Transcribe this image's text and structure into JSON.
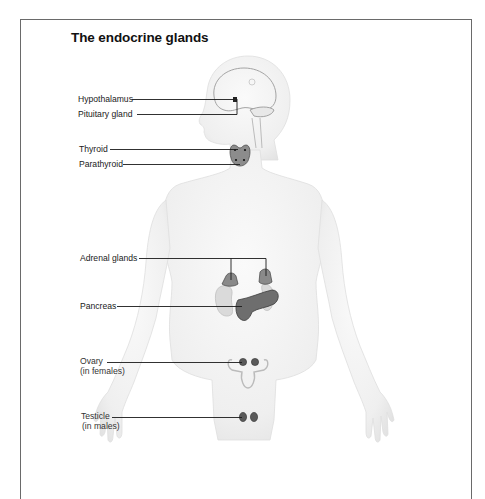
{
  "diagram": {
    "title": "The endocrine glands",
    "labels": {
      "hypothalamus": "Hypothalamus",
      "pituitary": "Pituitary gland",
      "thyroid": "Thyroid",
      "parathyroid": "Parathyroid",
      "adrenal": "Adrenal glands",
      "pancreas": "Pancreas",
      "ovary": "Ovary",
      "ovary_note": "(in females)",
      "testicle": "Testicle",
      "testicle_note": "(in males)"
    },
    "colors": {
      "frame": "#6a6a6a",
      "body_fill": "#f1f1f1",
      "body_outline": "#dcdcdc",
      "gland_dark": "#6e6e6e",
      "gland_light": "#d9d9d9",
      "leader_line": "#1a1a1a"
    }
  }
}
